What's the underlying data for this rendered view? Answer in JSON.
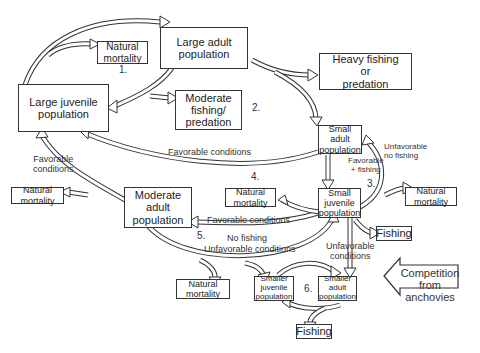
{
  "diagram": {
    "type": "population-dynamics-flow",
    "boxes": {
      "natural_mortality_1": "Natural\nmortality",
      "large_adult": "Large adult\npopulation",
      "large_juvenile": "Large juvenile\npopulation",
      "heavy_fishing": "Heavy fishing\nor\npredation",
      "moderate_fishing": "Moderate\nfishing/\npredation",
      "small_adult": "Small\nadult\npopulation",
      "natural_mortality_left": "Natural\nmortality",
      "moderate_adult": "Moderate\nadult\npopulation",
      "natural_mortality_4": "Natural\nmortality",
      "small_juvenile": "Small\njuvenile\npopulation",
      "natural_mortality_right": "Natural\nmortality",
      "fishing_right": "Fishing",
      "natural_mortality_bottom": "Natural\nmortality",
      "smaller_juvenile": "Smaller\njuvenile\npopulation",
      "smaller_adult": "Smaller\nadult\npopulation",
      "fishing_bottom": "Fishing",
      "competition": "Competition\nfrom anchovies"
    },
    "labels": {
      "favorable_conditions_top": "Favorable conditions",
      "favorable_conditions_left": "Favorable\nconditions",
      "unfavorable_no_fishing": "Unfavorable\nno fishing",
      "favorable_fishing": "Favorable\n+ fishing",
      "favorable_conditions_mid": "Favorable conditions",
      "no_fishing": "No fishing",
      "unfavorable_conditions_mid": "Unfavorable conditions",
      "unfavorable_conditions_right": "Unfavorable\nconditions"
    },
    "numbers": {
      "n1": "1.",
      "n2": "2.",
      "n3": "3.",
      "n4": "4.",
      "n5": "5.",
      "n6": "6."
    }
  }
}
